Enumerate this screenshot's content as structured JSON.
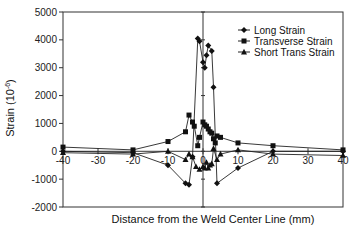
{
  "chart_data": {
    "type": "line",
    "title": "",
    "xlabel": "Distance from the Weld Center Line (mm)",
    "ylabel": "Strain (10^-6)",
    "ylabel_base": "Strain (10",
    "ylabel_exp": "-6",
    "ylabel_close": ")",
    "xlim": [
      -40,
      40
    ],
    "ylim": [
      -2000,
      5000
    ],
    "xticks": [
      -40,
      -30,
      -20,
      -10,
      0,
      10,
      20,
      30,
      40
    ],
    "yticks": [
      -2000,
      -1000,
      0,
      1000,
      2000,
      3000,
      4000,
      5000
    ],
    "grid": false,
    "legend_position": "upper right",
    "series": [
      {
        "name": "Long Strain",
        "marker": "diamond",
        "x": [
          -40,
          -20,
          -10,
          -5,
          -4,
          -3,
          -1.5,
          -1,
          0,
          0.5,
          1,
          1.5,
          2.5,
          3,
          4,
          10,
          20,
          40
        ],
        "y": [
          0,
          -50,
          -500,
          -1150,
          -1200,
          -200,
          4050,
          3950,
          3200,
          3000,
          3450,
          3800,
          3600,
          2300,
          -1150,
          -600,
          0,
          0
        ]
      },
      {
        "name": "Transverse Strain",
        "marker": "square",
        "x": [
          -40,
          -20,
          -10,
          -5,
          -4,
          -3,
          -2.5,
          -1.5,
          -1,
          0,
          0.5,
          1,
          1.5,
          2,
          2.5,
          3,
          3.5,
          4,
          5,
          10,
          20,
          40
        ],
        "y": [
          150,
          50,
          350,
          700,
          1300,
          1050,
          900,
          200,
          500,
          1050,
          950,
          900,
          800,
          700,
          650,
          450,
          300,
          550,
          500,
          300,
          200,
          50
        ]
      },
      {
        "name": "Short Trans Strain",
        "marker": "triangle",
        "x": [
          -40,
          -20,
          -10,
          -5,
          -4,
          -3,
          -2,
          -1,
          0,
          0.5,
          1,
          1.5,
          2,
          2.5,
          3,
          4,
          5,
          10,
          20,
          40
        ],
        "y": [
          -50,
          -100,
          0,
          -300,
          -100,
          -200,
          -550,
          -650,
          -550,
          -600,
          -400,
          -600,
          -500,
          -450,
          100,
          -300,
          -100,
          50,
          -100,
          -150
        ]
      }
    ]
  }
}
